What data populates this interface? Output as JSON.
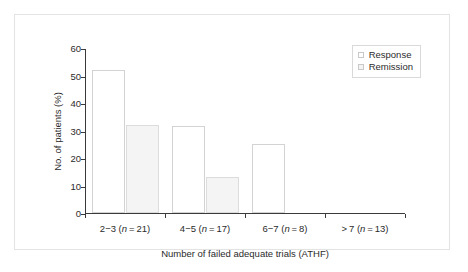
{
  "chart_data": {
    "type": "bar",
    "title": "",
    "subtitle": "",
    "xlabel": "Number of failed adequate trials (ATHF)",
    "ylabel": "No. of patients (%)",
    "ylim": [
      0,
      60
    ],
    "ytick_labels": [
      "0",
      "10",
      "20",
      "30",
      "40",
      "50",
      "60"
    ],
    "ytick_values": [
      0,
      10,
      20,
      30,
      40,
      50,
      60
    ],
    "grid": false,
    "legend_position": "top-right",
    "categories": [
      "2−3 (n = 21)",
      "4−5 (n = 17)",
      "6−7 (n = 8)",
      " > 7 (n = 13)"
    ],
    "category_parts": [
      {
        "range": "2−3 (",
        "italic": "n",
        "tail": " = 21)"
      },
      {
        "range": "4−5 (",
        "italic": "n",
        "tail": " = 17)"
      },
      {
        "range": "6−7 (",
        "italic": "n",
        "tail": " = 8)"
      },
      {
        "range": "> 7 (",
        "italic": "n",
        "tail": " = 13)"
      }
    ],
    "series": [
      {
        "name": "Response",
        "key": "response",
        "color": "#ffffff",
        "border": "#d3d3d3",
        "values": [
          52,
          31.5,
          25,
          0
        ]
      },
      {
        "name": "Remission",
        "key": "remission",
        "color": "#f4f4f4",
        "border": "#dcdcdc",
        "values": [
          32,
          13,
          0,
          0
        ]
      }
    ]
  },
  "legend": {
    "items": [
      {
        "label": "Response",
        "swatch": "response"
      },
      {
        "label": "Remission",
        "swatch": "remission"
      }
    ]
  },
  "figure": {
    "frame_color": "#e3e3e3",
    "axis_color": "#3a3a3a",
    "background": "#ffffff"
  }
}
